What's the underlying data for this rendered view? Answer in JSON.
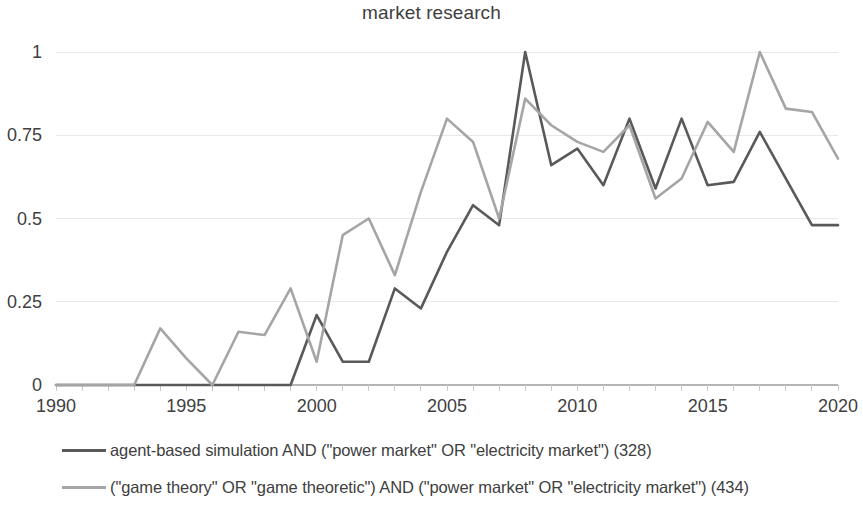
{
  "chart_data": {
    "type": "line",
    "title": "market research",
    "xlabel": "",
    "ylabel": "",
    "xlim": [
      1990,
      2020
    ],
    "ylim": [
      0,
      1
    ],
    "grid": true,
    "legend_position": "bottom",
    "x_ticks": [
      "1990",
      "1995",
      "2000",
      "2005",
      "2010",
      "2015",
      "2020"
    ],
    "y_ticks": [
      "0",
      "0.25",
      "0.5",
      "0.75",
      "1"
    ],
    "x": [
      1990,
      1991,
      1992,
      1993,
      1994,
      1995,
      1996,
      1997,
      1998,
      1999,
      2000,
      2001,
      2002,
      2003,
      2004,
      2005,
      2006,
      2007,
      2008,
      2009,
      2010,
      2011,
      2012,
      2013,
      2014,
      2015,
      2016,
      2017,
      2018,
      2019,
      2020
    ],
    "series": [
      {
        "name": "agent-based simulation AND (\"power market\" OR \"electricity market\") (328)",
        "color": "#595959",
        "values": [
          0,
          0,
          0,
          0,
          0,
          0,
          0,
          0,
          0,
          0,
          0.21,
          0.07,
          0.07,
          0.29,
          0.23,
          0.4,
          0.54,
          0.48,
          1.0,
          0.66,
          0.71,
          0.6,
          0.8,
          0.59,
          0.8,
          0.6,
          0.61,
          0.76,
          0.62,
          0.48,
          0.48
        ]
      },
      {
        "name": "(\"game theory\" OR \"game theoretic\") AND (\"power market\" OR \"electricity market\") (434)",
        "color": "#a5a5a5",
        "values": [
          0,
          0,
          0,
          0,
          0.17,
          0.08,
          0,
          0.16,
          0.15,
          0.29,
          0.07,
          0.45,
          0.5,
          0.33,
          0.58,
          0.8,
          0.73,
          0.5,
          0.86,
          0.78,
          0.73,
          0.7,
          0.78,
          0.56,
          0.62,
          0.79,
          0.7,
          1.0,
          0.83,
          0.82,
          0.68
        ]
      }
    ]
  },
  "legend": [
    {
      "label": "agent-based simulation AND (\"power market\" OR \"electricity market\") (328)",
      "color": "#595959"
    },
    {
      "label": "(\"game theory\" OR \"game theoretic\") AND (\"power market\" OR \"electricity market\") (434)",
      "color": "#a5a5a5"
    }
  ]
}
